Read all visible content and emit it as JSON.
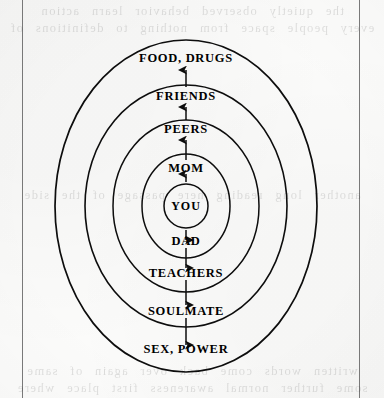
{
  "page": {
    "kind": "scanned-book-page",
    "background_color": "#fbfbfa",
    "ink_color": "#0d0d0d",
    "bleed_through_lines": [
      "the quietly observed behavior learn action",
      "every people space from nothing to definitions of",
      "another long reading here passage of the side",
      "written words come back over again of same",
      "some further normal awareness first place where"
    ]
  },
  "diagram": {
    "center": {
      "label": "YOU",
      "ring_index": 0
    },
    "rings": [
      {
        "index": 1,
        "label": "MOM",
        "side": "up",
        "radius_x": 44,
        "radius_y": 52
      },
      {
        "index": 2,
        "label": "PEERS",
        "side": "up",
        "radius_x": 73,
        "radius_y": 86
      },
      {
        "index": 3,
        "label": "FRIENDS",
        "side": "up",
        "radius_x": 101,
        "radius_y": 121
      },
      {
        "index": 4,
        "label": "FOOD, DRUGS",
        "side": "up",
        "radius_x": 131,
        "radius_y": 166
      },
      {
        "index": 1,
        "label": "DAD",
        "side": "down",
        "radius_x": 44,
        "radius_y": 52
      },
      {
        "index": 2,
        "label": "TEACHERS",
        "side": "down",
        "radius_x": 73,
        "radius_y": 86
      },
      {
        "index": 3,
        "label": "SOULMATE",
        "side": "down",
        "radius_x": 101,
        "radius_y": 121
      },
      {
        "index": 4,
        "label": "SEX, POWER",
        "side": "down",
        "radius_x": 131,
        "radius_y": 166
      }
    ],
    "labels_top_to_bottom": [
      "FOOD, DRUGS",
      "FRIENDS",
      "PEERS",
      "MOM",
      "YOU",
      "DAD",
      "TEACHERS",
      "SOULMATE",
      "SEX, POWER"
    ],
    "arrows": {
      "upper_direction": "up",
      "lower_direction": "down",
      "count_upper": 4,
      "count_lower": 4
    }
  }
}
